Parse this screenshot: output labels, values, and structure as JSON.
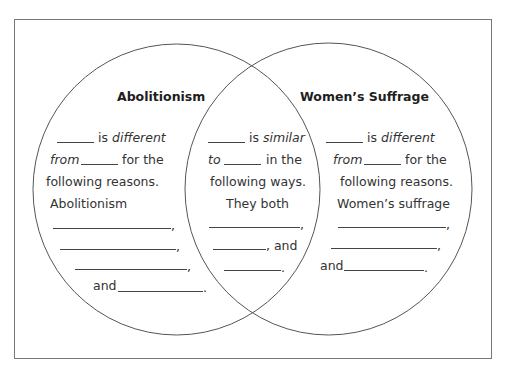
{
  "diagram": {
    "type": "venn",
    "frame": {
      "x": 14,
      "y": 19,
      "width": 477,
      "height": 339,
      "stroke": "#777777"
    },
    "circles": [
      {
        "name": "left",
        "cx": 176.5,
        "cy": 189.5,
        "rx": 143.5,
        "ry": 145.5,
        "stroke": "#555555"
      },
      {
        "name": "right",
        "cx": 328.5,
        "cy": 189,
        "rx": 143.5,
        "ry": 146,
        "stroke": "#555555"
      }
    ]
  },
  "left": {
    "title": "Abolitionism",
    "line1_text": "is",
    "line1_italic": "different",
    "line2_italic": "from",
    "line2_text": "for the",
    "line3": "following reasons.",
    "line4": "Abolitionism",
    "and_label": "and",
    "comma": ",",
    "period": "."
  },
  "middle": {
    "line1_text": "is",
    "line1_italic": "similar",
    "line2_italic": "to",
    "line2_text": "in the",
    "line3": "following ways.",
    "line4": "They both",
    "and_label": ", and",
    "comma": ",",
    "period": "."
  },
  "right": {
    "title": "Women’s Suffrage",
    "line1_text": "is",
    "line1_italic": "different",
    "line2_italic": "from",
    "line2_text": "for the",
    "line3": "following reasons.",
    "line4": "Women’s suffrage",
    "and_label": "and",
    "comma": ",",
    "period": "."
  }
}
